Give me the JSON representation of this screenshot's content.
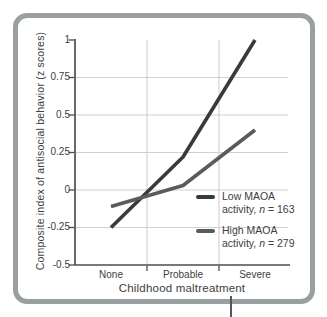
{
  "chart_data": {
    "type": "line",
    "title": "",
    "xlabel": "Childhood maltreatment",
    "ylabel": "Composite index of antisocial behavior (z scores)",
    "categories": [
      "None",
      "Probable",
      "Severe"
    ],
    "ylim": [
      -0.5,
      1
    ],
    "ytick_values": [
      1,
      0.75,
      0.5,
      0.25,
      0,
      -0.25,
      -0.5
    ],
    "ytick_labels": [
      "1",
      "0.75",
      "0.5",
      "0.25",
      "0",
      "-0.25",
      "-0.5"
    ],
    "grid_horizontal_at": [
      0.75,
      0.5,
      0.25,
      0,
      -0.25
    ],
    "grid_vertical_between_categories": true,
    "legend_position": "lower right",
    "series": [
      {
        "name": "Low MAOA",
        "detail_prefix": "activity, ",
        "detail_n_symbol": "n",
        "detail_suffix": " = 163",
        "n": 163,
        "values": [
          -0.25,
          0.22,
          1.0
        ],
        "color": "#3a3a3a"
      },
      {
        "name": "High MAOA",
        "detail_prefix": "activity, ",
        "detail_n_symbol": "n",
        "detail_suffix": " = 279",
        "n": 279,
        "values": [
          -0.11,
          0.03,
          0.4
        ],
        "color": "#595b5c"
      }
    ],
    "colors": {
      "grid": "#cdd1d1",
      "axis": "#4b4d4e",
      "text": "#3e4041",
      "frame_border": "#9aa0a2",
      "background": "#ffffff"
    }
  }
}
